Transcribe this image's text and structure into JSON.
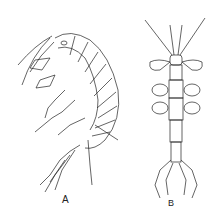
{
  "figure": {
    "panels": [
      {
        "label": "A",
        "subject": "gammarid amphipod, lateral view"
      },
      {
        "label": "B",
        "subject": "caprellid amphipod, dorsal view"
      }
    ],
    "style": {
      "line_color": "#222222",
      "background": "#ffffff"
    }
  }
}
